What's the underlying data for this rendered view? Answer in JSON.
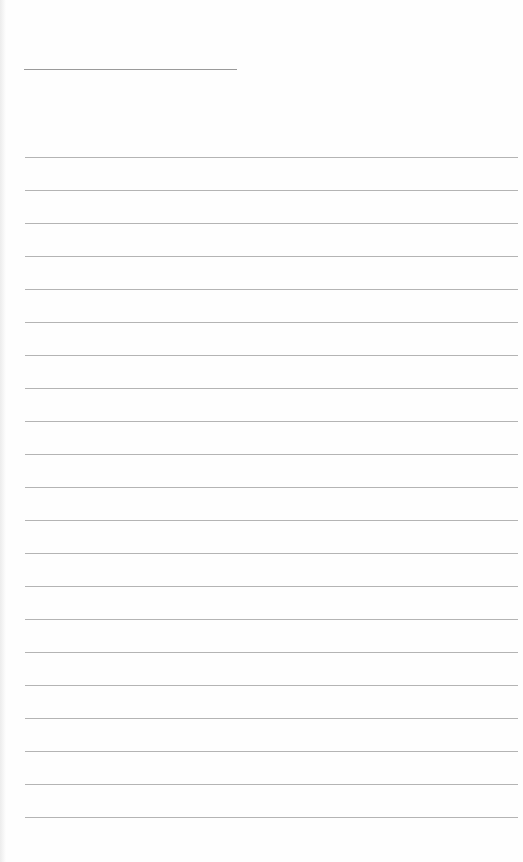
{
  "page": {
    "type": "lined-paper",
    "background_color": "#fefefe",
    "line_color": "#b4b4b4",
    "title_line": {
      "present": true,
      "text": ""
    },
    "rule_count": 21,
    "rule_start_y": 157,
    "rule_spacing": 33,
    "lines": [
      "",
      "",
      "",
      "",
      "",
      "",
      "",
      "",
      "",
      "",
      "",
      "",
      "",
      "",
      "",
      "",
      "",
      "",
      "",
      "",
      ""
    ]
  }
}
